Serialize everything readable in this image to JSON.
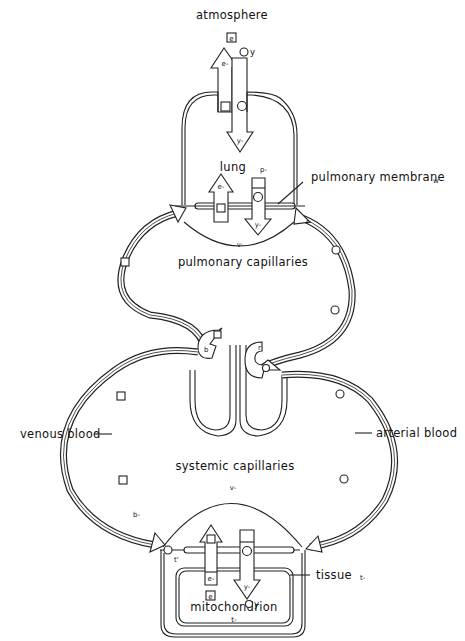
{
  "labels": {
    "atmosphere": "atmosphere",
    "lung": "lung",
    "lung_sub": "p-",
    "pulmonary_membrane": "pulmonary membrane",
    "pulmonary_membrane_sub": "w",
    "pulmonary_capillaries": "pulmonary capillaries",
    "venous_blood": "venous blood",
    "arterial_blood": "arterial blood",
    "systemic_capillaries": "systemic capillaries",
    "tissue": "tissue",
    "tissue_sub": "t-",
    "mitochondrion": "mitochondrion",
    "mitochondrion_sub": "t-"
  },
  "symbols": {
    "e_box": "e",
    "e_minus": "e-",
    "y": "y",
    "y_minus": "y-",
    "v_minus": "v-",
    "r_minus": "r-",
    "b_minus": "b-",
    "b": "b",
    "r": "r",
    "t_prime": "t'"
  },
  "legend_markers": {
    "square": "square-marker (CO2 species)",
    "circle": "circle-marker (O2 species)"
  }
}
